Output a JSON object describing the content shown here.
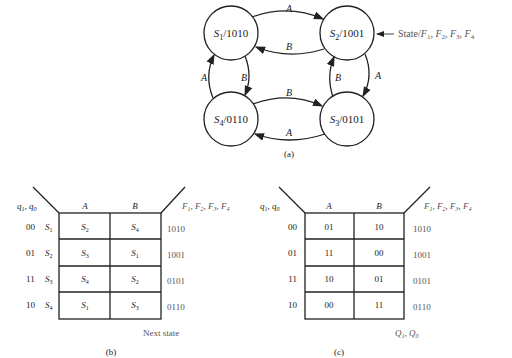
{
  "state_diagram": {
    "caption": "(a)",
    "annotation": "State/F1, F2, F3, F4",
    "states": [
      {
        "id": "S1",
        "output": "1010"
      },
      {
        "id": "S2",
        "output": "1001"
      },
      {
        "id": "S3",
        "output": "0101"
      },
      {
        "id": "S4",
        "output": "0110"
      }
    ],
    "transitions": [
      {
        "from": "S1",
        "to": "S2",
        "label": "A"
      },
      {
        "from": "S2",
        "to": "S1",
        "label": "B"
      },
      {
        "from": "S2",
        "to": "S3",
        "label": "A"
      },
      {
        "from": "S3",
        "to": "S2",
        "label": "B"
      },
      {
        "from": "S3",
        "to": "S4",
        "label": "A"
      },
      {
        "from": "S4",
        "to": "S3",
        "label": "B"
      },
      {
        "from": "S4",
        "to": "S1",
        "label": "A"
      },
      {
        "from": "S1",
        "to": "S4",
        "label": "B"
      }
    ]
  },
  "table_b": {
    "caption": "(b)",
    "row_header": "q1, q0",
    "col_headers": [
      "A",
      "B"
    ],
    "output_header": "F1, F2, F3, F4",
    "footer": "Next state",
    "rows": [
      {
        "code": "00",
        "state": "S1",
        "A": "S2",
        "B": "S4",
        "out": "1010"
      },
      {
        "code": "01",
        "state": "S2",
        "A": "S3",
        "B": "S1",
        "out": "1001"
      },
      {
        "code": "11",
        "state": "S3",
        "A": "S4",
        "B": "S2",
        "out": "0101"
      },
      {
        "code": "10",
        "state": "S4",
        "A": "S1",
        "B": "S3",
        "out": "0110"
      }
    ]
  },
  "table_c": {
    "caption": "(c)",
    "row_header": "q1, q0",
    "col_headers": [
      "A",
      "B"
    ],
    "output_header": "F1, F2, F3, F4",
    "footer": "Q1, Q0",
    "rows": [
      {
        "code": "00",
        "A": "01",
        "B": "10",
        "out": "1010"
      },
      {
        "code": "01",
        "A": "11",
        "B": "00",
        "out": "1001"
      },
      {
        "code": "11",
        "A": "10",
        "B": "01",
        "out": "0101"
      },
      {
        "code": "10",
        "A": "00",
        "B": "11",
        "out": "0110"
      }
    ]
  }
}
